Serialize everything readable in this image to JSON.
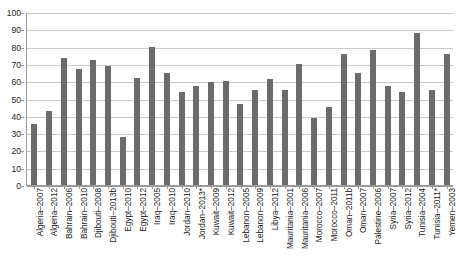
{
  "chart_data": {
    "type": "bar",
    "title": "",
    "subtitle": "",
    "xlabel": "",
    "ylabel": "",
    "ylim": [
      0,
      100
    ],
    "ytick_step": 10,
    "grid": true,
    "legend": false,
    "legend_position": "none",
    "bar_color": "#6b6b6b",
    "axis_color": "#9a9a9a",
    "grid_color": "#c9c9c9",
    "yticks": [
      "0",
      "10",
      "20",
      "30",
      "40",
      "50",
      "60",
      "70",
      "80",
      "90",
      "100"
    ],
    "categories": [
      "Algeria–2007",
      "Algeria–2012",
      "Bahrain–2006",
      "Bahrain–2010",
      "Djibouti–2008",
      "Djibouti–2013b",
      "Egypt–2010",
      "Egypt–2012",
      "Iraq–2005",
      "Iraq–2010",
      "Jordan–2010",
      "Jordan–2013*",
      "Kuwait–2009",
      "Kuwait–2012",
      "Lebanon–2005",
      "Lebanon–2009",
      "Libya–2012",
      "Mauritania–2001",
      "Mauritania–2006",
      "Morocco–2007",
      "Morocco–2011",
      "Oman–2011b",
      "Oman–2007",
      "Palestine–2006",
      "Syria–2007",
      "Syria–2012",
      "Tunisia–2004",
      "Tunisia–2011*",
      "Yemen–2003"
    ],
    "values": [
      35,
      43,
      73.5,
      67,
      72.5,
      69,
      27.5,
      62,
      80,
      64.5,
      53.5,
      57,
      59.5,
      60,
      47,
      55,
      61,
      55,
      70,
      38.5,
      45,
      76,
      65,
      78,
      57.5,
      53.5,
      88,
      55,
      76
    ]
  }
}
